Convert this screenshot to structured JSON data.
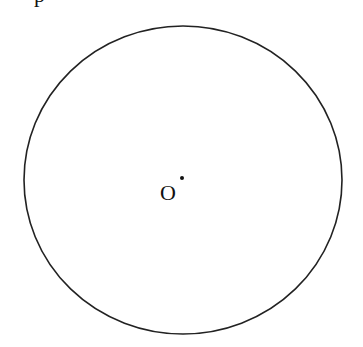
{
  "figure": {
    "type": "geometry-circle",
    "circle": {
      "cx": 183,
      "cy": 180,
      "rx": 159,
      "ry": 154,
      "stroke": "#222222",
      "stroke_width": 1.6
    },
    "center_point": {
      "x": 182,
      "y": 178,
      "r": 2,
      "color": "#111111"
    },
    "center_label": "O",
    "cutoff_text": "p"
  }
}
